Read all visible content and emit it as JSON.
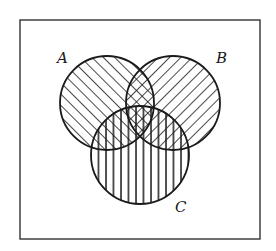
{
  "diagram": {
    "type": "venn",
    "frame": {
      "x": 20,
      "y": 20,
      "width": 240,
      "height": 219,
      "stroke": "#333333"
    },
    "sets": [
      {
        "id": "A",
        "label": "A",
        "cx": 107,
        "cy": 103,
        "r": 47,
        "hatch": "diagonal-forward",
        "label_x": 57,
        "label_y": 53
      },
      {
        "id": "B",
        "label": "B",
        "cx": 173,
        "cy": 103,
        "r": 47,
        "hatch": "diagonal-backward",
        "label_x": 215,
        "label_y": 53
      },
      {
        "id": "C",
        "label": "C",
        "cx": 140,
        "cy": 155,
        "r": 49,
        "hatch": "vertical",
        "label_x": 175,
        "label_y": 201
      }
    ],
    "regions": {
      "A_and_B": "cross-hatched",
      "A_and_C": "forward-diagonal + vertical",
      "B_and_C": "backward-diagonal + vertical"
    },
    "colors": {
      "ink": "#1a1a1a",
      "background": "#ffffff"
    }
  }
}
